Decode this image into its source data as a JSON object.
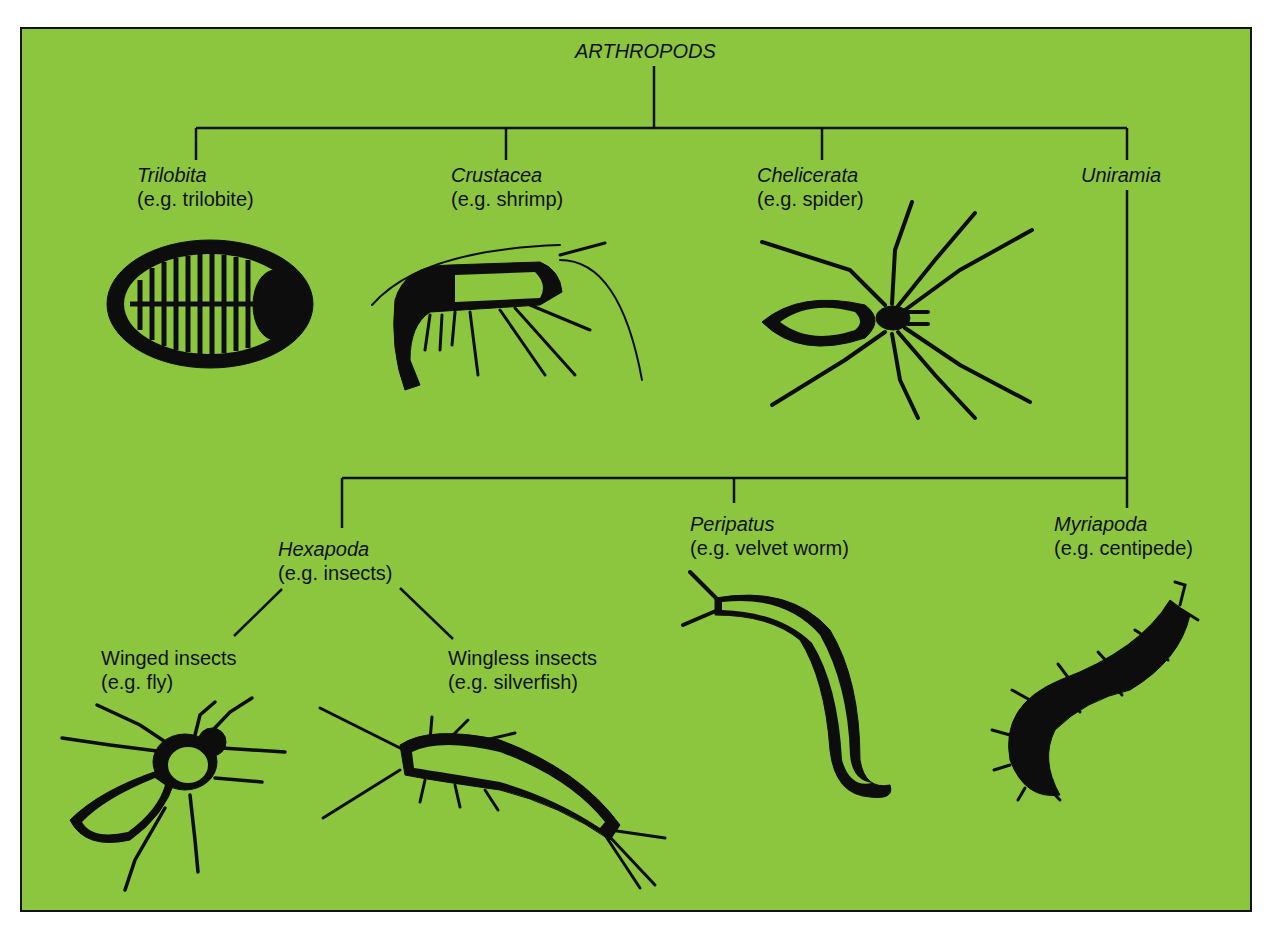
{
  "diagram": {
    "title": "ARTHROPODS",
    "background_color": "#8cc63f",
    "line_color": "#111111",
    "groups": [
      {
        "id": "trilobita",
        "name": "Trilobita",
        "example": "(e.g. trilobite)",
        "icon": "trilobite-illustration"
      },
      {
        "id": "crustacea",
        "name": "Crustacea",
        "example": "(e.g. shrimp)",
        "icon": "shrimp-illustration"
      },
      {
        "id": "chelicerata",
        "name": "Chelicerata",
        "example": "(e.g. spider)",
        "icon": "spider-illustration"
      },
      {
        "id": "uniramia",
        "name": "Uniramia"
      }
    ],
    "uniramia_children": [
      {
        "id": "hexapoda",
        "name": "Hexapoda",
        "example": "(e.g. insects)"
      },
      {
        "id": "peripatus",
        "name": "Peripatus",
        "example": "(e.g. velvet worm)",
        "icon": "velvet-worm-illustration"
      },
      {
        "id": "myriapoda",
        "name": "Myriapoda",
        "example": "(e.g. centipede)",
        "icon": "centipede-illustration"
      }
    ],
    "hexapoda_children": [
      {
        "id": "winged",
        "name": "Winged insects",
        "example": "(e.g. fly)",
        "icon": "fly-illustration"
      },
      {
        "id": "wingless",
        "name": "Wingless insects",
        "example": "(e.g. silverfish)",
        "icon": "silverfish-illustration"
      }
    ]
  }
}
